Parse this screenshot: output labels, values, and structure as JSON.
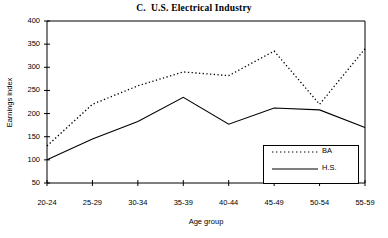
{
  "chart_data": {
    "type": "line",
    "title": "C.  U.S. Electrical Industry",
    "xlabel": "Age group",
    "ylabel": "Earnings index",
    "categories": [
      "20-24",
      "25-29",
      "30-34",
      "35-39",
      "40-44",
      "45-49",
      "50-54",
      "55-59"
    ],
    "yticks": [
      50,
      100,
      150,
      200,
      250,
      300,
      350,
      400
    ],
    "ylim": [
      50,
      400
    ],
    "grid": false,
    "legend_position": "inside-bottom-right",
    "series": [
      {
        "name": "BA",
        "style": "dotted",
        "color": "#000000",
        "values": [
          130,
          220,
          260,
          290,
          282,
          335,
          220,
          340
        ]
      },
      {
        "name": "H.S.",
        "style": "solid",
        "color": "#000000",
        "values": [
          100,
          145,
          183,
          235,
          177,
          212,
          208,
          170
        ]
      }
    ]
  },
  "legend": {
    "items": [
      {
        "label": "BA"
      },
      {
        "label": "H.S."
      }
    ]
  }
}
